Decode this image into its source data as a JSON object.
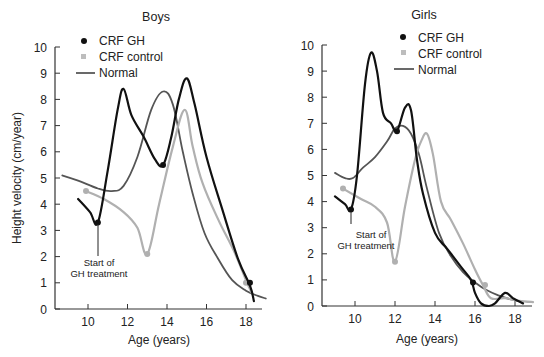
{
  "figure": {
    "ylabel": "Height velocity (cm/year)",
    "xlabel": "Age (years)",
    "annotation": [
      "Start of",
      "GH treatment"
    ]
  },
  "legend": [
    {
      "label": "CRF GH",
      "marker": "dot",
      "color": "#111111"
    },
    {
      "label": "CRF control",
      "marker": "dot",
      "color": "#b0b0b0"
    },
    {
      "label": "Normal",
      "marker": "line",
      "color": "#555555"
    }
  ],
  "chart_data": [
    {
      "type": "line",
      "title": "Boys",
      "xlabel": "Age (years)",
      "ylabel": "Height velocity (cm/year)",
      "xticks": [
        10,
        12,
        14,
        16,
        18
      ],
      "yticks": [
        0,
        1,
        2,
        3,
        4,
        5,
        6,
        7,
        8,
        9,
        10
      ],
      "xlim": [
        8.5,
        19
      ],
      "ylim": [
        0,
        10
      ],
      "annotation": {
        "text": "Start of GH treatment",
        "x": 10.5,
        "y": 3.3
      },
      "series": [
        {
          "name": "CRF GH",
          "color": "#111111",
          "width": 2.2,
          "x": [
            9.5,
            10.1,
            10.5,
            11.0,
            11.5,
            11.8,
            12.2,
            12.8,
            13.4,
            13.8,
            14.2,
            14.6,
            15.0,
            15.4,
            16.0,
            16.8,
            17.6,
            18.2,
            18.4
          ],
          "y": [
            4.2,
            3.7,
            3.3,
            5.3,
            7.6,
            8.4,
            7.4,
            6.6,
            5.7,
            5.5,
            6.5,
            8.0,
            8.8,
            7.8,
            5.8,
            3.8,
            1.9,
            0.9,
            0.3
          ],
          "markers": [
            [
              10.5,
              3.3
            ],
            [
              13.8,
              5.5
            ],
            [
              18.2,
              1.0
            ]
          ]
        },
        {
          "name": "CRF control",
          "color": "#b0b0b0",
          "width": 2.2,
          "x": [
            9.9,
            10.8,
            11.8,
            12.5,
            13.0,
            13.6,
            14.3,
            14.9,
            15.3,
            15.8,
            16.6,
            17.4,
            18.0,
            18.3
          ],
          "y": [
            4.5,
            4.2,
            3.7,
            3.1,
            2.1,
            4.0,
            6.2,
            7.6,
            6.2,
            4.8,
            3.4,
            2.2,
            1.1,
            0.6
          ],
          "markers": [
            [
              9.9,
              4.5
            ],
            [
              13.0,
              2.1
            ],
            [
              18.0,
              1.0
            ]
          ]
        },
        {
          "name": "Normal",
          "color": "#555555",
          "width": 1.8,
          "x": [
            8.7,
            9.5,
            10.5,
            11.2,
            11.8,
            12.5,
            13.2,
            13.8,
            14.3,
            14.8,
            15.3,
            15.9,
            16.6,
            17.3,
            18.0,
            18.6,
            19.0
          ],
          "y": [
            5.1,
            4.9,
            4.6,
            4.5,
            4.7,
            5.8,
            7.6,
            8.3,
            7.8,
            6.0,
            4.4,
            2.9,
            1.9,
            1.1,
            0.7,
            0.5,
            0.4
          ],
          "markers": []
        }
      ]
    },
    {
      "type": "line",
      "title": "Girls",
      "xlabel": "Age (years)",
      "ylabel": "",
      "xticks": [
        10,
        12,
        14,
        16,
        18
      ],
      "yticks": [
        0,
        1,
        2,
        3,
        4,
        5,
        6,
        7,
        8,
        9,
        10
      ],
      "xlim": [
        8.5,
        19
      ],
      "ylim": [
        0,
        10
      ],
      "annotation": {
        "text": "Start of GH treatment",
        "x": 9.8,
        "y": 3.7
      },
      "series": [
        {
          "name": "CRF GH",
          "color": "#111111",
          "width": 2.2,
          "x": [
            9.0,
            9.5,
            9.8,
            10.1,
            10.5,
            10.8,
            11.1,
            11.4,
            11.8,
            12.1,
            12.5,
            12.8,
            13.1,
            13.4,
            14.0,
            14.6,
            15.3,
            15.8,
            16.0,
            16.3,
            16.7,
            17.0,
            17.5,
            17.9,
            18.4
          ],
          "y": [
            4.2,
            3.9,
            3.7,
            5.0,
            8.5,
            9.7,
            9.0,
            7.4,
            7.0,
            6.7,
            7.6,
            7.5,
            5.6,
            4.3,
            2.8,
            2.2,
            1.5,
            1.0,
            0.5,
            0.1,
            0.0,
            0.1,
            0.5,
            0.3,
            0.1
          ],
          "markers": [
            [
              9.8,
              3.7
            ],
            [
              12.1,
              6.7
            ],
            [
              15.9,
              0.9
            ]
          ]
        },
        {
          "name": "CRF control",
          "color": "#b0b0b0",
          "width": 2.2,
          "x": [
            9.4,
            10.3,
            11.0,
            11.6,
            12.0,
            12.5,
            13.0,
            13.3,
            13.6,
            13.9,
            14.3,
            14.8,
            15.4,
            16.0,
            16.4,
            16.8,
            17.5,
            18.2,
            18.9
          ],
          "y": [
            4.5,
            4.1,
            3.8,
            3.2,
            1.7,
            3.8,
            5.6,
            6.3,
            6.6,
            5.8,
            4.0,
            3.3,
            2.4,
            1.4,
            0.8,
            0.3,
            0.3,
            0.2,
            0.15
          ],
          "markers": [
            [
              9.4,
              4.5
            ],
            [
              12.0,
              1.7
            ],
            [
              16.5,
              0.8
            ]
          ]
        },
        {
          "name": "Normal",
          "color": "#555555",
          "width": 1.8,
          "x": [
            9.0,
            9.5,
            9.9,
            10.4,
            11.0,
            11.6,
            12.0,
            12.4,
            12.8,
            13.2,
            13.6,
            14.2,
            14.8,
            15.4,
            16.0,
            16.6,
            17.2,
            17.8,
            18.4
          ],
          "y": [
            5.1,
            4.9,
            4.9,
            5.3,
            5.7,
            6.3,
            6.8,
            6.9,
            6.6,
            5.8,
            4.5,
            2.8,
            1.9,
            1.3,
            0.9,
            0.6,
            0.4,
            0.25,
            0.15
          ],
          "markers": []
        }
      ]
    }
  ]
}
